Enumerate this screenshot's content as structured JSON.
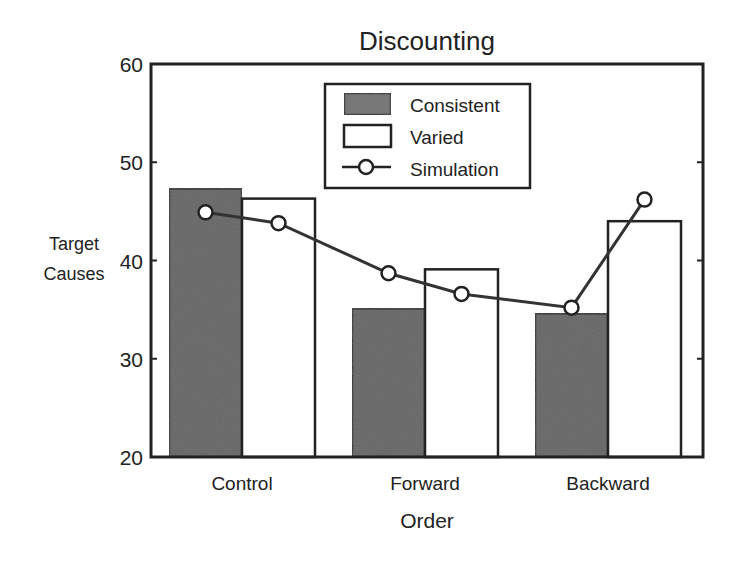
{
  "chart_data": {
    "type": "bar",
    "title": "Discounting",
    "xlabel": "Order",
    "ylabel": "Target Causes",
    "ylabel_lines": [
      "Target",
      "Causes"
    ],
    "ylim": [
      20,
      60
    ],
    "yticks": [
      20,
      30,
      40,
      50,
      60
    ],
    "grid": false,
    "legend_position": "upper center",
    "categories": [
      "Control",
      "Forward",
      "Backward"
    ],
    "series": [
      {
        "name": "Consistent",
        "kind": "bar",
        "values": [
          47.3,
          35.1,
          34.6
        ],
        "color": "#5a5a5a"
      },
      {
        "name": "Varied",
        "kind": "bar",
        "values": [
          46.3,
          39.1,
          44.0
        ],
        "color": "#ffffff"
      },
      {
        "name": "Simulation",
        "kind": "line",
        "marker": "open-circle",
        "values": [
          [
            44.9,
            43.8
          ],
          [
            38.7,
            36.6
          ],
          [
            35.2,
            46.2
          ]
        ]
      }
    ]
  },
  "legend": {
    "items": [
      "Consistent",
      "Varied",
      "Simulation"
    ]
  }
}
